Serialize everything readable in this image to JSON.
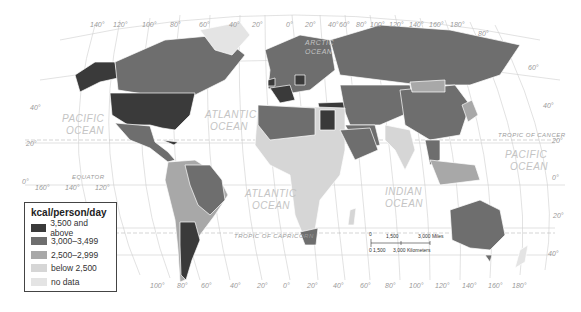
{
  "map": {
    "title": "kcal/person/day",
    "legend": [
      {
        "label": "3,500 and above",
        "color": "#3a3a3a"
      },
      {
        "label": "3,000–3,499",
        "color": "#6e6e6e"
      },
      {
        "label": "2,500–2,999",
        "color": "#a8a8a8"
      },
      {
        "label": "below 2,500",
        "color": "#d6d6d6"
      },
      {
        "label": "no data",
        "color": "#e4e4e4"
      }
    ],
    "oceans": [
      "PACIFIC OCEAN",
      "ATLANTIC OCEAN",
      "ARCTIC OCEAN",
      "ATLANTIC OCEAN",
      "INDIAN OCEAN",
      "PACIFIC OCEAN"
    ],
    "lines": {
      "equator": "EQUATOR",
      "tropic_cancer": "TROPIC OF CANCER",
      "tropic_capricorn": "TROPIC OF CAPRICORN"
    },
    "top_longitudes": [
      "140°",
      "120°",
      "100°",
      "80°",
      "60°",
      "40°",
      "20°",
      "0°",
      "20°",
      "40°",
      "60°",
      "80°",
      "100°",
      "120°",
      "140°",
      "160°",
      "180°"
    ],
    "bottom_longitudes": [
      "160°",
      "140°",
      "120°",
      "100°",
      "80°",
      "60°",
      "40°",
      "20°",
      "0°",
      "20°",
      "40°",
      "60°",
      "80°",
      "100°",
      "120°",
      "140°",
      "160°",
      "180°"
    ],
    "latitudes_left": [
      "40°",
      "20°",
      "0°",
      "20°",
      "40°"
    ],
    "latitudes_right": [
      "80°",
      "60°",
      "40°",
      "20°",
      "0°",
      "20°",
      "40°"
    ],
    "scale": {
      "miles": [
        "0",
        "1,500",
        "3,000 Miles"
      ],
      "km": [
        "0",
        "1,500",
        "3,000 Kilometers"
      ]
    }
  }
}
